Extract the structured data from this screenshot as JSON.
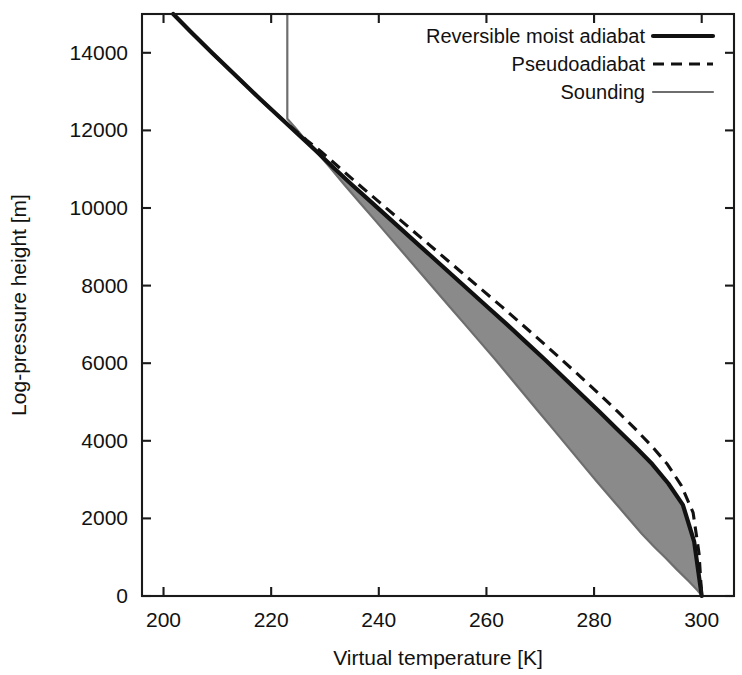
{
  "chart_data": {
    "type": "line",
    "title": "",
    "xlabel": "Virtual temperature [K]",
    "ylabel": "Log-pressure height [m]",
    "xlim": [
      196,
      306
    ],
    "ylim": [
      0,
      15000
    ],
    "xticks": [
      200,
      220,
      240,
      260,
      280,
      300
    ],
    "yticks": [
      0,
      2000,
      4000,
      6000,
      8000,
      10000,
      12000,
      14000
    ],
    "xticklabels": [
      "200",
      "220",
      "240",
      "260",
      "280",
      "300"
    ],
    "yticklabels": [
      "0",
      "2000",
      "4000",
      "6000",
      "8000",
      "10000",
      "12000",
      "14000"
    ],
    "grid": false,
    "legend_position": "top-right",
    "frame": "box",
    "shaded_region": {
      "label": "CAPE (area between sounding and reversible moist adiabat)",
      "color": "#8a8a8a"
    },
    "series": [
      {
        "name": "Reversible moist adiabat",
        "style": "solid-thick",
        "color": "#111111",
        "x": [
          201.8,
          205.0,
          209.0,
          213.5,
          218.0,
          222.3,
          226.2,
          228.5,
          231.5,
          235.0,
          238.6,
          242.2,
          245.8,
          249.4,
          253.0,
          256.6,
          260.2,
          263.8,
          267.3,
          270.8,
          274.2,
          277.6,
          281.0,
          284.3,
          287.6,
          290.8,
          293.8,
          296.5,
          298.6,
          300.0
        ],
        "y": [
          15000,
          14550,
          14000,
          13400,
          12800,
          12250,
          11750,
          11450,
          11050,
          10600,
          10150,
          9700,
          9250,
          8800,
          8350,
          7900,
          7450,
          7000,
          6550,
          6100,
          5650,
          5200,
          4750,
          4300,
          3850,
          3400,
          2900,
          2350,
          1400,
          0
        ]
      },
      {
        "name": "Pseudoadiabat",
        "style": "dashed",
        "color": "#111111",
        "x": [
          201.8,
          205.0,
          209.0,
          213.5,
          218.0,
          222.3,
          226.6,
          229.3,
          232.6,
          236.3,
          240.1,
          243.9,
          247.7,
          251.5,
          255.3,
          259.1,
          262.9,
          266.6,
          270.3,
          273.9,
          277.5,
          281.0,
          284.4,
          287.7,
          290.8,
          293.6,
          296.2,
          298.4,
          299.5,
          300.0
        ],
        "y": [
          15000,
          14550,
          14000,
          13400,
          12800,
          12250,
          11750,
          11450,
          11050,
          10600,
          10150,
          9700,
          9250,
          8800,
          8350,
          7900,
          7450,
          7000,
          6550,
          6100,
          5650,
          5200,
          4750,
          4300,
          3850,
          3400,
          2850,
          2150,
          1100,
          0
        ]
      },
      {
        "name": "Sounding",
        "style": "solid-thin",
        "color": "#6e6e6e",
        "x": [
          223.0,
          223.0,
          223.0,
          224.6,
          226.4,
          228.4,
          230.9,
          233.6,
          236.4,
          239.2,
          242.0,
          244.8,
          247.6,
          250.4,
          253.2,
          256.0,
          258.8,
          261.6,
          264.3,
          267.0,
          269.7,
          272.4,
          275.1,
          277.8,
          280.5,
          283.3,
          286.1,
          288.9,
          291.3,
          293.3,
          295.4,
          297.6,
          299.2,
          300.1
        ],
        "y": [
          15000,
          13600,
          12300,
          12050,
          11750,
          11450,
          11050,
          10600,
          10150,
          9700,
          9250,
          8800,
          8350,
          7900,
          7450,
          7000,
          6550,
          6100,
          5650,
          5200,
          4750,
          4300,
          3850,
          3400,
          2950,
          2500,
          2050,
          1600,
          1250,
          980,
          680,
          380,
          150,
          0
        ]
      }
    ]
  },
  "legend": {
    "items": [
      {
        "label": "Reversible moist adiabat",
        "style": "solid-thick"
      },
      {
        "label": "Pseudoadiabat",
        "style": "dashed"
      },
      {
        "label": "Sounding",
        "style": "solid-thin"
      }
    ]
  }
}
